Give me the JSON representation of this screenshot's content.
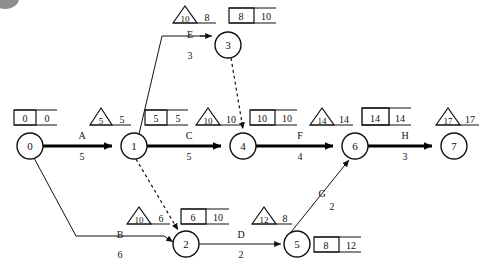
{
  "diagram": {
    "type": "activity-on-arrow-network",
    "nodes": [
      {
        "id": "0",
        "label": "0",
        "x": 30,
        "y": 146,
        "r": 13
      },
      {
        "id": "1",
        "label": "1",
        "x": 134,
        "y": 146,
        "r": 13
      },
      {
        "id": "2",
        "label": "2",
        "x": 186,
        "y": 244,
        "r": 13
      },
      {
        "id": "3",
        "label": "3",
        "x": 228,
        "y": 45,
        "r": 13
      },
      {
        "id": "4",
        "label": "4",
        "x": 243,
        "y": 146,
        "r": 13
      },
      {
        "id": "5",
        "label": "5",
        "x": 297,
        "y": 244,
        "r": 13
      },
      {
        "id": "6",
        "label": "6",
        "x": 355,
        "y": 146,
        "r": 13
      },
      {
        "id": "7",
        "label": "7",
        "x": 454,
        "y": 146,
        "r": 13
      }
    ],
    "activities": [
      {
        "name": "A",
        "duration": "5",
        "from": "0",
        "to": "1",
        "critical": true,
        "label_x": 82,
        "name_y": 139,
        "dur_y": 158
      },
      {
        "name": "C",
        "duration": "5",
        "from": "1",
        "to": "4",
        "critical": true,
        "label_x": 189,
        "name_y": 139,
        "dur_y": 158
      },
      {
        "name": "F",
        "duration": "4",
        "from": "4",
        "to": "6",
        "critical": true,
        "label_x": 300,
        "name_y": 139,
        "dur_y": 158
      },
      {
        "name": "H",
        "duration": "3",
        "from": "6",
        "to": "7",
        "critical": true,
        "label_x": 405,
        "name_y": 139,
        "dur_y": 158
      },
      {
        "name": "B",
        "duration": "6",
        "from": "0",
        "to": "2",
        "critical": false,
        "label_x": 120,
        "name_y": 238,
        "dur_y": 257
      },
      {
        "name": "D",
        "duration": "2",
        "from": "2",
        "to": "5",
        "critical": false,
        "label_x": 241,
        "name_y": 238,
        "dur_y": 257
      },
      {
        "name": "E",
        "duration": "3",
        "from": "1",
        "to": "3",
        "critical": false,
        "label_x": 190,
        "name_y": 38,
        "dur_y": 58
      },
      {
        "name": "G",
        "duration": "2",
        "from": "5",
        "to": "6",
        "critical": false,
        "label_x": 324,
        "name_y": 196,
        "dur_y": 210
      }
    ],
    "dummies": [
      {
        "from": "3",
        "to": "4",
        "style": "dashed"
      },
      {
        "from": "1",
        "to": "2",
        "style": "dashed"
      }
    ],
    "node_times": [
      {
        "node": "0",
        "triangle_inner": null,
        "triangle_outer": null,
        "box_inner": "0",
        "box_outer": "0",
        "box_x": 14,
        "box_y": 112
      },
      {
        "node": "1",
        "triangle_inner": "5",
        "triangle_outer": "5",
        "tri_x": 90,
        "tri_y": 112,
        "box_inner": "5",
        "box_outer": "5",
        "box_x": 145,
        "box_y": 112
      },
      {
        "node": "2",
        "triangle_inner": "10",
        "triangle_outer": "6",
        "tri_x": 127,
        "tri_y": 211,
        "box_inner": "6",
        "box_outer": "10",
        "box_x": 181,
        "box_y": 211
      },
      {
        "node": "3",
        "triangle_inner": "10",
        "triangle_outer": "8",
        "tri_x": 173,
        "tri_y": 10,
        "box_inner": "8",
        "box_outer": "10",
        "box_x": 229,
        "box_y": 10
      },
      {
        "node": "4",
        "triangle_inner": "10",
        "triangle_outer": "10",
        "tri_x": 196,
        "tri_y": 112,
        "box_inner": "10",
        "box_outer": "10",
        "box_x": 250,
        "box_y": 112
      },
      {
        "node": "5",
        "triangle_inner": "12",
        "triangle_outer": "8",
        "tri_x": 252,
        "tri_y": 211,
        "box_inner": "8",
        "box_outer": "12",
        "box_x": 314,
        "box_y": 211
      },
      {
        "node": "6",
        "triangle_inner": "14",
        "triangle_outer": "14",
        "tri_x": 310,
        "tri_y": 112,
        "box_inner": "14",
        "box_outer": "14",
        "box_x": 362,
        "box_y": 112
      },
      {
        "node": "7",
        "triangle_inner": "17",
        "triangle_outer": "17",
        "tri_x": 436,
        "tri_y": 112,
        "box_inner": null,
        "box_outer": null
      }
    ],
    "colors": {
      "stroke": "#111111",
      "critical_stroke": "#000000",
      "background": "#ffffff",
      "corner_blob": "#8e8e8e"
    }
  }
}
